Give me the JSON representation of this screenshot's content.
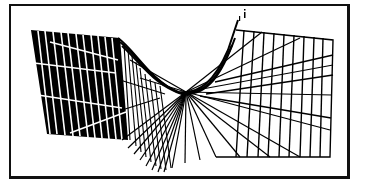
{
  "figure": {
    "type": "wireframe-ruled-surface",
    "colors": {
      "background": "#ffffff",
      "frame": "#111111",
      "mesh_dark": "#000000",
      "mesh_light_lines": "#ffffff"
    },
    "frame": {
      "x": 9,
      "y": 4,
      "width": 341,
      "height": 175
    },
    "left_panel": {
      "fill": "#000000",
      "corners": [
        [
          31,
          30
        ],
        [
          118,
          40
        ],
        [
          128,
          140
        ],
        [
          47,
          132
        ]
      ],
      "vertical_line_count": 12,
      "horizontal_line_count": 3
    },
    "right_panel": {
      "corners": [
        [
          236,
          28
        ],
        [
          333,
          40
        ],
        [
          330,
          157
        ],
        [
          216,
          157
        ]
      ],
      "vertical_line_count": 12,
      "horizontal_line_count": 3
    },
    "fan": {
      "apex": [
        186,
        92
      ],
      "line_count": 22
    },
    "annotation_mark": "i"
  }
}
